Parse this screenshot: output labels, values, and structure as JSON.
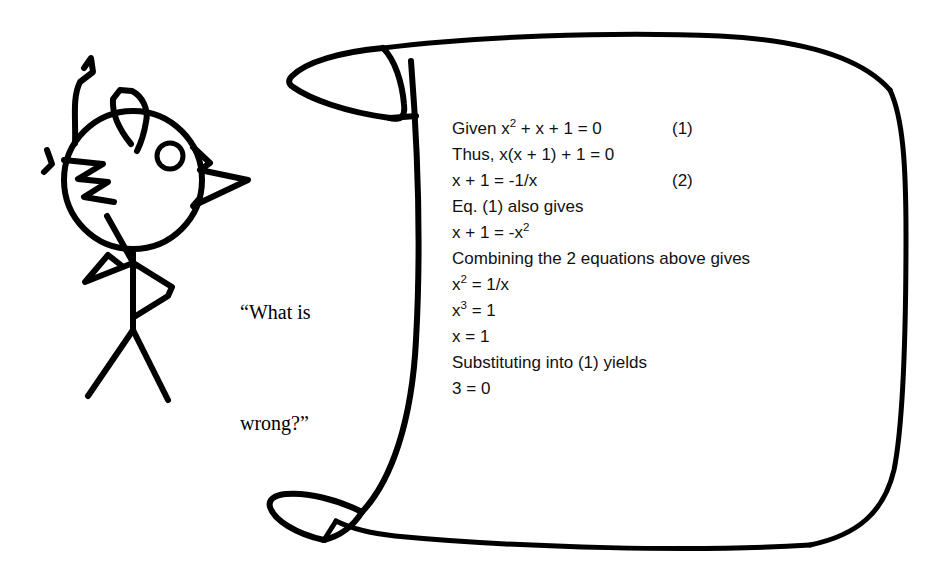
{
  "canvas": {
    "width": 939,
    "height": 588,
    "background_color": "#ffffff",
    "ink_color": "#000000"
  },
  "figure": {
    "name": "stick-figure-person"
  },
  "speech": {
    "line1": "“What is",
    "line2": "wrong?”"
  },
  "scroll": {
    "name": "scroll-banner",
    "description": "hand-drawn curled scroll containing a flawed algebraic proof"
  },
  "proof": {
    "lines": [
      {
        "body": "Given x² + x + 1 = 0",
        "tag": "(1)"
      },
      {
        "body": "Thus, x(x + 1) + 1 = 0",
        "tag": ""
      },
      {
        "body": "x + 1 = -1/x",
        "tag": "(2)"
      },
      {
        "body": "Eq. (1) also gives",
        "tag": ""
      },
      {
        "body": "x + 1 = -x²",
        "tag": ""
      },
      {
        "body": "Combining the 2 equations above gives",
        "tag": ""
      },
      {
        "body": "x² = 1/x",
        "tag": ""
      },
      {
        "body": "x³ = 1",
        "tag": ""
      },
      {
        "body": "x = 1",
        "tag": ""
      },
      {
        "body": "Substituting into (1) yields",
        "tag": ""
      },
      {
        "body": "3 = 0",
        "tag": ""
      }
    ]
  }
}
